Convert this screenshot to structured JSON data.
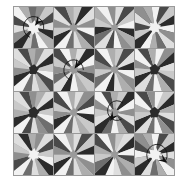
{
  "figure": {
    "background_color": "#ffffff",
    "border_color": "#9a9a9a",
    "grid": {
      "rows": 4,
      "cols": 4,
      "gap_px": 1
    }
  },
  "palette": {
    "darkest": "#2b2b2b",
    "dark": "#4a4a4a",
    "mid_dark": "#6e6e6e",
    "mid": "#8f8f8f",
    "mid_light": "#aeaeae",
    "light": "#c9c9c9",
    "lighter": "#dedede",
    "lightest": "#f2f2f2",
    "white": "#fbfbfb",
    "arrow": "#111111"
  },
  "tiles": [
    {
      "index": 0,
      "row": 0,
      "col": 0,
      "name": "tile-r0c0",
      "rotation_deg": 8,
      "center_shape": "star",
      "center_color": "#f2f2f2",
      "center_radius": 20,
      "wedges": [
        "#8f8f8f",
        "#c9c9c9",
        "#4a4a4a",
        "#dedede",
        "#2b2b2b",
        "#aeaeae",
        "#f2f2f2",
        "#6e6e6e",
        "#c9c9c9",
        "#2b2b2b",
        "#8f8f8f",
        "#dedede",
        "#4a4a4a",
        "#f2f2f2",
        "#aeaeae",
        "#6e6e6e"
      ],
      "annotated": true,
      "arrow": {
        "cx": 36,
        "cy": 38,
        "r": 24,
        "start_deg": 200,
        "sweep_deg": 260,
        "head_deg": 40,
        "direction": "clockwise"
      }
    },
    {
      "index": 1,
      "row": 0,
      "col": 1,
      "name": "tile-r0c1",
      "rotation_deg": 0,
      "center_shape": "star",
      "center_color": "#9a9a9a",
      "center_radius": 14,
      "wedges": [
        "#c9c9c9",
        "#2b2b2b",
        "#dedede",
        "#8f8f8f",
        "#f2f2f2",
        "#4a4a4a",
        "#aeaeae",
        "#dedede",
        "#6e6e6e",
        "#f2f2f2",
        "#2b2b2b",
        "#c9c9c9",
        "#8f8f8f",
        "#dedede",
        "#4a4a4a",
        "#aeaeae"
      ],
      "annotated": false,
      "arrow": null
    },
    {
      "index": 2,
      "row": 0,
      "col": 2,
      "name": "tile-r0c2",
      "rotation_deg": 3,
      "center_shape": "star",
      "center_color": "#9a9a9a",
      "center_radius": 13,
      "wedges": [
        "#dedede",
        "#4a4a4a",
        "#c9c9c9",
        "#f2f2f2",
        "#2b2b2b",
        "#aeaeae",
        "#8f8f8f",
        "#f2f2f2",
        "#4a4a4a",
        "#dedede",
        "#6e6e6e",
        "#2b2b2b",
        "#c9c9c9",
        "#aeaeae",
        "#f2f2f2",
        "#8f8f8f"
      ],
      "annotated": false,
      "arrow": null
    },
    {
      "index": 3,
      "row": 0,
      "col": 3,
      "name": "tile-r0c3",
      "rotation_deg": 14,
      "center_shape": "star",
      "center_color": "#f2f2f2",
      "center_radius": 19,
      "wedges": [
        "#4a4a4a",
        "#c9c9c9",
        "#2b2b2b",
        "#f2f2f2",
        "#8f8f8f",
        "#dedede",
        "#6e6e6e",
        "#aeaeae",
        "#f2f2f2",
        "#2b2b2b",
        "#c9c9c9",
        "#4a4a4a",
        "#dedede",
        "#8f8f8f",
        "#aeaeae",
        "#f2f2f2"
      ],
      "annotated": false,
      "arrow": null
    },
    {
      "index": 4,
      "row": 1,
      "col": 0,
      "name": "tile-r1c0",
      "rotation_deg": 6,
      "center_shape": "blob",
      "center_color": "#2b2b2b",
      "center_radius": 16,
      "wedges": [
        "#8f8f8f",
        "#dedede",
        "#2b2b2b",
        "#c9c9c9",
        "#f2f2f2",
        "#4a4a4a",
        "#aeaeae",
        "#dedede",
        "#6e6e6e",
        "#f2f2f2",
        "#2b2b2b",
        "#8f8f8f",
        "#c9c9c9",
        "#dedede",
        "#4a4a4a",
        "#aeaeae"
      ],
      "annotated": false,
      "arrow": null
    },
    {
      "index": 5,
      "row": 1,
      "col": 1,
      "name": "tile-r1c1",
      "rotation_deg": 10,
      "center_shape": "star",
      "center_color": "#9a9a9a",
      "center_radius": 15,
      "wedges": [
        "#dedede",
        "#2b2b2b",
        "#f2f2f2",
        "#8f8f8f",
        "#4a4a4a",
        "#c9c9c9",
        "#aeaeae",
        "#f2f2f2",
        "#2b2b2b",
        "#dedede",
        "#6e6e6e",
        "#8f8f8f",
        "#c9c9c9",
        "#4a4a4a",
        "#f2f2f2",
        "#aeaeae"
      ],
      "annotated": true,
      "arrow": {
        "cx": 36,
        "cy": 40,
        "r": 23,
        "start_deg": 195,
        "sweep_deg": 255,
        "head_deg": 35,
        "direction": "clockwise"
      }
    },
    {
      "index": 6,
      "row": 1,
      "col": 2,
      "name": "tile-r1c2",
      "rotation_deg": 2,
      "center_shape": "star",
      "center_color": "#9a9a9a",
      "center_radius": 14,
      "wedges": [
        "#c9c9c9",
        "#4a4a4a",
        "#dedede",
        "#2b2b2b",
        "#f2f2f2",
        "#8f8f8f",
        "#aeaeae",
        "#dedede",
        "#2b2b2b",
        "#f2f2f2",
        "#6e6e6e",
        "#c9c9c9",
        "#8f8f8f",
        "#4a4a4a",
        "#f2f2f2",
        "#aeaeae"
      ],
      "annotated": false,
      "arrow": null
    },
    {
      "index": 7,
      "row": 1,
      "col": 3,
      "name": "tile-r1c3",
      "rotation_deg": 4,
      "center_shape": "blob",
      "center_color": "#2b2b2b",
      "center_radius": 17,
      "wedges": [
        "#f2f2f2",
        "#8f8f8f",
        "#2b2b2b",
        "#dedede",
        "#c9c9c9",
        "#4a4a4a",
        "#aeaeae",
        "#f2f2f2",
        "#6e6e6e",
        "#dedede",
        "#2b2b2b",
        "#c9c9c9",
        "#8f8f8f",
        "#f2f2f2",
        "#4a4a4a",
        "#aeaeae"
      ],
      "annotated": false,
      "arrow": null
    },
    {
      "index": 8,
      "row": 2,
      "col": 0,
      "name": "tile-r2c0",
      "rotation_deg": 9,
      "center_shape": "blob",
      "center_color": "#2b2b2b",
      "center_radius": 18,
      "wedges": [
        "#aeaeae",
        "#dedede",
        "#2b2b2b",
        "#c9c9c9",
        "#f2f2f2",
        "#6e6e6e",
        "#8f8f8f",
        "#dedede",
        "#4a4a4a",
        "#f2f2f2",
        "#2b2b2b",
        "#aeaeae",
        "#c9c9c9",
        "#dedede",
        "#4a4a4a",
        "#8f8f8f"
      ],
      "annotated": false,
      "arrow": null
    },
    {
      "index": 9,
      "row": 2,
      "col": 1,
      "name": "tile-r2c1",
      "rotation_deg": 5,
      "center_shape": "star",
      "center_color": "#9a9a9a",
      "center_radius": 14,
      "wedges": [
        "#dedede",
        "#8f8f8f",
        "#4a4a4a",
        "#f2f2f2",
        "#2b2b2b",
        "#c9c9c9",
        "#aeaeae",
        "#dedede",
        "#6e6e6e",
        "#f2f2f2",
        "#2b2b2b",
        "#8f8f8f",
        "#c9c9c9",
        "#4a4a4a",
        "#f2f2f2",
        "#aeaeae"
      ],
      "annotated": false,
      "arrow": null
    },
    {
      "index": 10,
      "row": 2,
      "col": 2,
      "name": "tile-r2c2",
      "rotation_deg": 11,
      "center_shape": "star",
      "center_color": "#9a9a9a",
      "center_radius": 15,
      "wedges": [
        "#c9c9c9",
        "#2b2b2b",
        "#f2f2f2",
        "#8f8f8f",
        "#dedede",
        "#4a4a4a",
        "#aeaeae",
        "#f2f2f2",
        "#6e6e6e",
        "#2b2b2b",
        "#dedede",
        "#c9c9c9",
        "#8f8f8f",
        "#f2f2f2",
        "#4a4a4a",
        "#aeaeae"
      ],
      "annotated": true,
      "arrow": {
        "cx": 42,
        "cy": 34,
        "r": 22,
        "start_deg": 150,
        "sweep_deg": 250,
        "head_deg": 215,
        "direction": "counterclockwise"
      }
    },
    {
      "index": 11,
      "row": 2,
      "col": 3,
      "name": "tile-r2c3",
      "rotation_deg": 1,
      "center_shape": "blob",
      "center_color": "#2b2b2b",
      "center_radius": 17,
      "wedges": [
        "#f2f2f2",
        "#c9c9c9",
        "#2b2b2b",
        "#aeaeae",
        "#dedede",
        "#4a4a4a",
        "#8f8f8f",
        "#f2f2f2",
        "#6e6e6e",
        "#dedede",
        "#2b2b2b",
        "#c9c9c9",
        "#aeaeae",
        "#f2f2f2",
        "#4a4a4a",
        "#8f8f8f"
      ],
      "annotated": false,
      "arrow": null
    },
    {
      "index": 12,
      "row": 3,
      "col": 0,
      "name": "tile-r3c0",
      "rotation_deg": 7,
      "center_shape": "star",
      "center_color": "#f2f2f2",
      "center_radius": 18,
      "wedges": [
        "#8f8f8f",
        "#dedede",
        "#4a4a4a",
        "#c9c9c9",
        "#f2f2f2",
        "#2b2b2b",
        "#aeaeae",
        "#dedede",
        "#6e6e6e",
        "#f2f2f2",
        "#4a4a4a",
        "#8f8f8f",
        "#c9c9c9",
        "#dedede",
        "#2b2b2b",
        "#aeaeae"
      ],
      "annotated": false,
      "arrow": null
    },
    {
      "index": 13,
      "row": 3,
      "col": 1,
      "name": "tile-r3c1",
      "rotation_deg": 0,
      "center_shape": "star",
      "center_color": "#9a9a9a",
      "center_radius": 14,
      "wedges": [
        "#dedede",
        "#4a4a4a",
        "#c9c9c9",
        "#2b2b2b",
        "#f2f2f2",
        "#8f8f8f",
        "#aeaeae",
        "#dedede",
        "#6e6e6e",
        "#f2f2f2",
        "#2b2b2b",
        "#c9c9c9",
        "#8f8f8f",
        "#4a4a4a",
        "#f2f2f2",
        "#aeaeae"
      ],
      "annotated": false,
      "arrow": null
    },
    {
      "index": 14,
      "row": 3,
      "col": 2,
      "name": "tile-r3c2",
      "rotation_deg": 3,
      "center_shape": "star",
      "center_color": "#9a9a9a",
      "center_radius": 14,
      "wedges": [
        "#c9c9c9",
        "#dedede",
        "#2b2b2b",
        "#f2f2f2",
        "#4a4a4a",
        "#aeaeae",
        "#8f8f8f",
        "#dedede",
        "#f2f2f2",
        "#2b2b2b",
        "#6e6e6e",
        "#c9c9c9",
        "#aeaeae",
        "#4a4a4a",
        "#f2f2f2",
        "#8f8f8f"
      ],
      "annotated": false,
      "arrow": null
    },
    {
      "index": 15,
      "row": 3,
      "col": 3,
      "name": "tile-r3c3",
      "rotation_deg": 13,
      "center_shape": "star",
      "center_color": "#f2f2f2",
      "center_radius": 20,
      "wedges": [
        "#4a4a4a",
        "#c9c9c9",
        "#2b2b2b",
        "#dedede",
        "#8f8f8f",
        "#f2f2f2",
        "#aeaeae",
        "#6e6e6e",
        "#dedede",
        "#2b2b2b",
        "#c9c9c9",
        "#f2f2f2",
        "#4a4a4a",
        "#8f8f8f",
        "#aeaeae",
        "#f2f2f2"
      ],
      "annotated": true,
      "arrow": {
        "cx": 42,
        "cy": 40,
        "r": 24,
        "start_deg": 230,
        "sweep_deg": 250,
        "head_deg": 125,
        "direction": "counterclockwise"
      }
    }
  ]
}
